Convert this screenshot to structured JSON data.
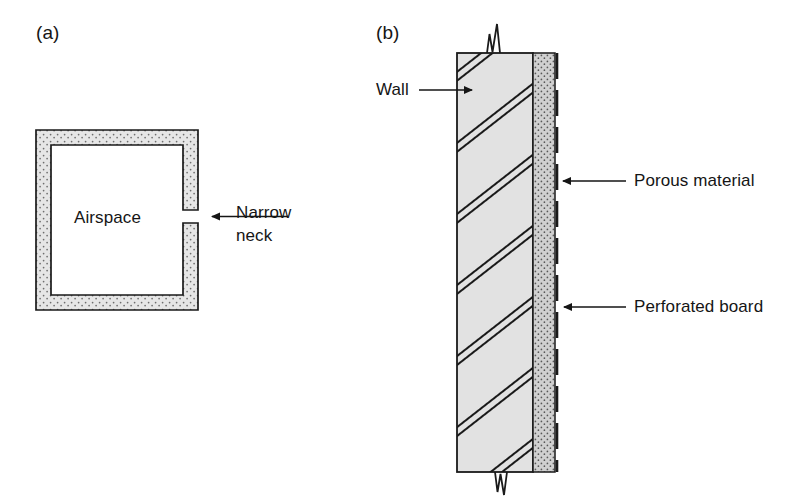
{
  "figure": {
    "type": "technical-diagram",
    "background_color": "#ffffff",
    "ink_color": "#151515"
  },
  "panels": [
    {
      "id": "a",
      "tag": "(a)",
      "title_hidden": "Helmholtz resonator cavity",
      "labels": {
        "airspace": "Airspace",
        "narrow_neck_line1": "Narrow",
        "narrow_neck_line2": "neck"
      },
      "geometry": {
        "outer_left": 36,
        "outer_top": 130,
        "outer_right": 198,
        "outer_bottom": 310,
        "wall_thickness": 15,
        "neck_gap_top": 210,
        "neck_gap_bottom": 223
      },
      "colors": {
        "wall_fill": "#e3e3e3",
        "wall_stipple": "#7a7a7a",
        "cavity_fill": "#ffffff",
        "outline": "#1a1a1a"
      }
    },
    {
      "id": "b",
      "tag": "(b)",
      "title_hidden": "Perforated panel absorber on wall",
      "labels": {
        "wall": "Wall",
        "porous_material": "Porous material",
        "perforated_board": "Perforated board"
      },
      "geometry": {
        "wall_left": 457,
        "wall_right": 533,
        "wall_top": 53,
        "wall_bottom": 472,
        "porous_left": 533,
        "porous_right": 555,
        "board_x": 557
      },
      "colors": {
        "wall_fill": "#e2e2e2",
        "wall_hatch": "#1a1a1a",
        "porous_fill": "#cdcdcd",
        "porous_stipple": "#5d5d5d",
        "board_line": "#1a1a1a",
        "outline": "#1a1a1a"
      }
    }
  ],
  "annotations": [
    {
      "name": "narrow-neck",
      "text_lines": [
        "Narrow",
        "neck"
      ],
      "arrow_from_x": 288,
      "arrow_from_y": 216,
      "arrow_to_x": 207,
      "arrow_to_y": 216,
      "text_x": 236,
      "text_y": 203
    },
    {
      "name": "wall",
      "text_lines": [
        "Wall"
      ],
      "arrow_from_x": 419,
      "arrow_from_y": 90,
      "arrow_to_x": 466,
      "arrow_to_y": 90,
      "text_x": 376,
      "text_y": 80
    },
    {
      "name": "porous-material",
      "text_lines": [
        "Porous material"
      ],
      "arrow_from_x": 624,
      "arrow_from_y": 181,
      "arrow_to_x": 560,
      "arrow_to_y": 181,
      "text_x": 632,
      "text_y": 170
    },
    {
      "name": "perforated-board",
      "text_lines": [
        "Perforated board"
      ],
      "arrow_from_x": 624,
      "arrow_from_y": 307,
      "arrow_to_x": 561,
      "arrow_to_y": 307,
      "text_x": 632,
      "text_y": 296
    }
  ]
}
